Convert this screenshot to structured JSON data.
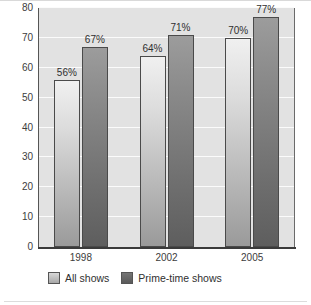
{
  "chart_data": {
    "type": "bar",
    "title": "",
    "subtitle": "",
    "xlabel": "",
    "ylabel": "",
    "categories": [
      "1998",
      "2002",
      "2005"
    ],
    "series": [
      {
        "name": "All shows",
        "color": "#c0c0c0",
        "values": [
          56,
          64,
          70
        ],
        "data_labels": [
          "56%",
          "64%",
          "70%"
        ]
      },
      {
        "name": "Prime-time shows",
        "color": "#707070",
        "values": [
          67,
          71,
          77
        ],
        "data_labels": [
          "67%",
          "71%",
          "77%"
        ]
      }
    ],
    "ylim": [
      0,
      80
    ],
    "ytick_values": [
      0,
      10,
      20,
      30,
      40,
      50,
      60,
      70,
      80
    ],
    "ytick_labels": [
      "0",
      "10",
      "20",
      "30",
      "40",
      "50",
      "60",
      "70",
      "80"
    ],
    "grid": true,
    "grid_axis": "y",
    "legend_position": "bottom-left",
    "plot_background": "#e2e2e2",
    "gridline_color": "#fbfbfb",
    "axis_color": "#3a3a3a"
  },
  "legend": {
    "items": [
      {
        "label": "All shows"
      },
      {
        "label": "Prime-time shows"
      }
    ]
  }
}
